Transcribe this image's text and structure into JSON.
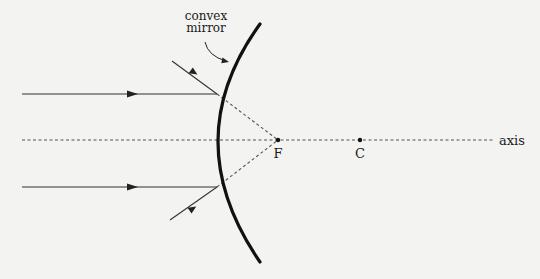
{
  "diagram": {
    "title_label_line1": "convex",
    "title_label_line2": "mirror",
    "focal_point_label": "F",
    "center_label": "C",
    "axis_label": "axis"
  },
  "colors": {
    "background": "#f3f3f2",
    "ink": "#1a1a1a",
    "ray": "#333333",
    "dashed": "#555555"
  },
  "elements": {
    "mirror": "convex mirror arc",
    "incident_rays": [
      "upper parallel ray",
      "lower parallel ray"
    ],
    "reflected_rays": [
      "upper reflected ray",
      "lower reflected ray"
    ],
    "virtual_extensions": [
      "dashed line to F (upper)",
      "dashed line to F (lower)"
    ],
    "points": [
      "F",
      "C"
    ]
  }
}
